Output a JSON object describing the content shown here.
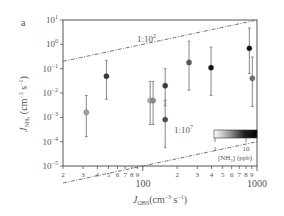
{
  "panel_label": "a",
  "chart_data": {
    "type": "scatter",
    "title": "",
    "panel": "a",
    "xlabel": "J_OBS (cm^-3 s^-1)",
    "ylabel": "J_NH3 (cm^-3 s^-1)",
    "xscale": "log",
    "yscale": "log",
    "xlim": [
      20,
      1000
    ],
    "ylim": [
      1e-05,
      10
    ],
    "x_major_ticks": [
      {
        "value": 100,
        "label": "100"
      },
      {
        "value": 1000,
        "label": "1000"
      }
    ],
    "x_minor_tick_labels": [
      {
        "value": 20,
        "label": "2"
      },
      {
        "value": 30,
        "label": "3"
      },
      {
        "value": 40,
        "label": "4"
      },
      {
        "value": 50,
        "label": "5"
      },
      {
        "value": 60,
        "label": "6"
      },
      {
        "value": 70,
        "label": "7"
      },
      {
        "value": 80,
        "label": "8"
      },
      {
        "value": 90,
        "label": "9"
      },
      {
        "value": 200,
        "label": "2"
      },
      {
        "value": 300,
        "label": "3"
      },
      {
        "value": 400,
        "label": "4"
      },
      {
        "value": 500,
        "label": "5"
      },
      {
        "value": 600,
        "label": "6"
      },
      {
        "value": 700,
        "label": "7"
      },
      {
        "value": 800,
        "label": "8"
      },
      {
        "value": 900,
        "label": "9"
      }
    ],
    "y_ticks": [
      {
        "exp": 1,
        "label": "10^1"
      },
      {
        "exp": 0,
        "label": "10^0"
      },
      {
        "exp": -1,
        "label": "10^-1"
      },
      {
        "exp": -2,
        "label": "10^-2"
      },
      {
        "exp": -3,
        "label": "10^-3"
      },
      {
        "exp": -4,
        "label": "10^-4"
      },
      {
        "exp": -5,
        "label": "10^-5"
      }
    ],
    "grid": false,
    "reference_lines": [
      {
        "label": "1:10^2",
        "ratio": 100,
        "style": "dash-dot",
        "description": "J_NH3 = J_OBS / 100"
      },
      {
        "label": "1:10^7",
        "ratio": 10000000.0,
        "style": "dash-dot",
        "description": "J_NH3 = J_OBS / 1e7"
      }
    ],
    "colorbar": {
      "label": "[NH3] (ppb)",
      "scale": "log",
      "ticks": [
        {
          "value": 1,
          "label": "1"
        },
        {
          "value": 10,
          "label": "10"
        }
      ],
      "range": [
        1,
        20
      ],
      "colormap": "white-to-black",
      "position": "lower-right inside axes"
    },
    "points": [
      {
        "x": 32,
        "y": 0.0016,
        "y_low": 0.00016,
        "y_high": 0.0079,
        "nh3_ppb": 1.5,
        "color": "#a0a0a0"
      },
      {
        "x": 48,
        "y": 0.049,
        "y_low": 0.0055,
        "y_high": 0.22,
        "nh3_ppb": 8,
        "color": "#3a3a3a"
      },
      {
        "x": 116,
        "y": 0.0049,
        "y_low": 0.00051,
        "y_high": 0.03,
        "nh3_ppb": 1.5,
        "color": "#b0b0b0"
      },
      {
        "x": 123,
        "y": 0.0049,
        "y_low": 0.00051,
        "y_high": 0.03,
        "nh3_ppb": 2.5,
        "color": "#8a8a8a"
      },
      {
        "x": 157,
        "y": 0.02,
        "y_low": 0.003,
        "y_high": 0.1,
        "nh3_ppb": 8,
        "color": "#3a3a3a"
      },
      {
        "x": 157,
        "y": 0.00081,
        "y_low": 5.6e-05,
        "y_high": 0.005,
        "nh3_ppb": 6,
        "color": "#4a4a4a"
      },
      {
        "x": 254,
        "y": 0.18,
        "y_low": 0.013,
        "y_high": 1.35,
        "nh3_ppb": 4,
        "color": "#5a5a5a"
      },
      {
        "x": 396,
        "y": 0.11,
        "y_low": 0.008,
        "y_high": 0.77,
        "nh3_ppb": 15,
        "color": "#111111"
      },
      {
        "x": 857,
        "y": 0.69,
        "y_low": 0.064,
        "y_high": 4.7,
        "nh3_ppb": 15,
        "color": "#111111"
      },
      {
        "x": 910,
        "y": 0.04,
        "y_low": 0.0028,
        "y_high": 0.3,
        "nh3_ppb": 3,
        "color": "#707070"
      }
    ]
  },
  "labels": {
    "upper_line": "1:10",
    "upper_line_sup": "2",
    "lower_line": "1:10",
    "lower_line_sup": "7",
    "x_axis_main": "J",
    "x_axis_sub": "OBS",
    "x_axis_units": "(cm",
    "x_axis_units_sup1": "−3",
    "x_axis_units_mid": " s",
    "x_axis_units_sup2": "−1",
    "x_axis_units_end": ")",
    "y_axis_main": "J",
    "y_axis_sub": "NH",
    "y_axis_sub2": "3",
    "y_axis_units": " (cm",
    "y_axis_units_sup1": "−3",
    "y_axis_units_mid": " s",
    "y_axis_units_sup2": "−1",
    "y_axis_units_end": ")",
    "colorbar_label_pre": "[NH",
    "colorbar_label_sub": "3",
    "colorbar_label_post": "] (ppb)",
    "colorbar_tick_1": "1",
    "colorbar_tick_10": "10",
    "x_tick_100": "100",
    "x_tick_1000": "1000"
  },
  "colors": {
    "axis": "#555555",
    "reference_line": "#666666",
    "errorbar": "#777777"
  }
}
